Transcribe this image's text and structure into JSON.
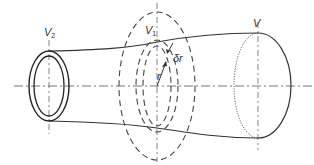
{
  "diagram": {
    "labels": {
      "v2": "V",
      "v2_sub": "2",
      "v1": "V",
      "v1_sub": "1",
      "v": "V",
      "dr": "δr",
      "r": "r"
    },
    "colors": {
      "stroke": "#333333",
      "dashed": "#555555",
      "background": "#ffffff"
    }
  }
}
